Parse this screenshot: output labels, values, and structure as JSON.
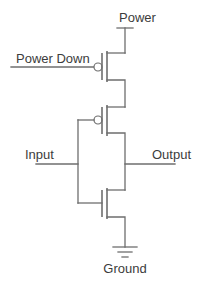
{
  "diagram": {
    "type": "circuit-schematic",
    "labels": {
      "power": "Power",
      "power_down": "Power Down",
      "input": "Input",
      "output": "Output",
      "ground": "Ground"
    },
    "components": [
      {
        "id": "pmos-power-down",
        "type": "PMOS",
        "gate": "Power Down",
        "source": "Power",
        "drain": "pmos-input.source"
      },
      {
        "id": "pmos-input",
        "type": "PMOS",
        "gate": "Input",
        "source": "pmos-power-down.drain",
        "drain": "Output"
      },
      {
        "id": "nmos-input",
        "type": "NMOS",
        "gate": "Input",
        "drain": "Output",
        "source": "Ground"
      }
    ],
    "colors": {
      "line": "#6e6e6e",
      "text": "#3c3c3c",
      "background": "#ffffff"
    }
  }
}
